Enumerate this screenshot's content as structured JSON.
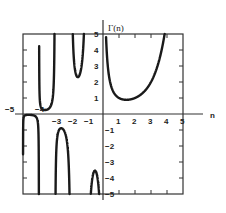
{
  "chart_data": {
    "type": "line",
    "title": "",
    "function": "Gamma",
    "ylabel": "Γ(n)",
    "xlabel": "n",
    "xlim": [
      -5,
      5
    ],
    "ylim": [
      -5,
      5
    ],
    "grid": false,
    "x_tick_labels": [
      "-5",
      "-4",
      "-3",
      "-2",
      "-1",
      "1",
      "2",
      "3",
      "4",
      "5"
    ],
    "y_tick_labels": [
      "5",
      "4",
      "3",
      "2",
      "1",
      "-1",
      "-2",
      "-3",
      "-4",
      "-5"
    ],
    "series": [
      {
        "name": "Gamma(n), n>0",
        "x": [
          0.2,
          0.5,
          1,
          1.46,
          2,
          3,
          4
        ],
        "y": [
          4.59,
          1.77,
          1,
          0.886,
          1,
          2,
          6
        ]
      },
      {
        "name": "Gamma(n), -1<n<0",
        "x": [
          -0.2,
          -0.5,
          -0.8
        ],
        "y": [
          -5.82,
          -3.54,
          -5.74
        ]
      },
      {
        "name": "Gamma(n), -2<n<-1",
        "x": [
          -1.2,
          -1.5,
          -1.8
        ],
        "y": [
          4.85,
          2.36,
          3.19
        ]
      },
      {
        "name": "Gamma(n), -3<n<-2",
        "x": [
          -2.2,
          -2.5,
          -2.8
        ],
        "y": [
          -2.2,
          -0.945,
          -1.14
        ]
      },
      {
        "name": "Gamma(n), -4<n<-3",
        "x": [
          -3.2,
          -3.5,
          -3.8
        ],
        "y": [
          0.69,
          0.27,
          0.3
        ]
      },
      {
        "name": "Gamma(n), -5<n<-4",
        "x": [
          -4.2,
          -4.5,
          -4.8
        ],
        "y": [
          -0.16,
          -0.06,
          -0.06
        ]
      }
    ]
  },
  "labels": {
    "y_axis_title": "Γ(n)",
    "x_axis_title": "n"
  },
  "colors": {
    "curve": "#1a1a1a",
    "axis": "#333333"
  }
}
